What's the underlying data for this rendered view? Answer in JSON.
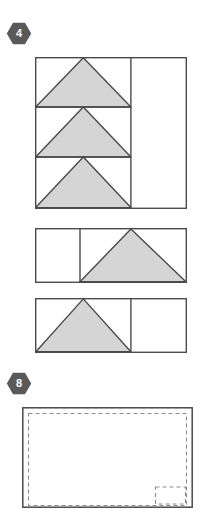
{
  "page": {
    "width": 206,
    "height": 499,
    "background": "#ffffff"
  },
  "style": {
    "stroke_color": "#4a4a4a",
    "fill_shaded": "#d5d5d5",
    "fill_empty": "#ffffff",
    "badge_color": "#595959",
    "badge_text_color": "#ffffff",
    "dashed_color": "#8c8c8c",
    "stroke_width": 1.4
  },
  "badges": [
    {
      "id": "badge-4",
      "label": "4",
      "x": 6,
      "y": 22,
      "shape": "hexagon"
    },
    {
      "id": "badge-8",
      "label": "8",
      "x": 6,
      "y": 372,
      "shape": "hexagon"
    }
  ],
  "figures": [
    {
      "id": "figure-1",
      "name": "square-three-stacked-triangles",
      "x": 35,
      "y": 57,
      "width": 151,
      "height": 151,
      "vertical_divider_x": 96,
      "row_divider_ys": [
        50,
        100
      ],
      "cells": [
        {
          "name": "top-left-cell",
          "shaded": true,
          "shape": "triangle-up"
        },
        {
          "name": "middle-left-cell",
          "shaded": true,
          "shape": "triangle-up"
        },
        {
          "name": "bottom-left-cell",
          "shaded": true,
          "shape": "triangle-up"
        },
        {
          "name": "right-column-cell",
          "shaded": false,
          "shape": "rectangle"
        }
      ]
    },
    {
      "id": "figure-2",
      "name": "rectangle-empty-left-triangle-right",
      "x": 35,
      "y": 228,
      "width": 151,
      "height": 54,
      "vertical_divider_x": 45,
      "cells": [
        {
          "name": "left-cell",
          "shaded": false,
          "shape": "rectangle"
        },
        {
          "name": "right-cell",
          "shaded": true,
          "shape": "triangle-up"
        }
      ]
    },
    {
      "id": "figure-3",
      "name": "rectangle-triangle-left-empty-right",
      "x": 35,
      "y": 298,
      "width": 151,
      "height": 54,
      "vertical_divider_x": 96,
      "cells": [
        {
          "name": "left-cell",
          "shaded": true,
          "shape": "triangle-up"
        },
        {
          "name": "right-cell",
          "shaded": false,
          "shape": "rectangle"
        }
      ]
    },
    {
      "id": "figure-4",
      "name": "rectangle-with-dashed-inset-and-corner-box",
      "x": 22,
      "y": 407,
      "width": 170,
      "height": 100,
      "inset": 6,
      "corner_box": {
        "name": "corner-dashed-box",
        "width": 30,
        "height": 16,
        "right_offset": 6,
        "bottom_offset": 6
      }
    }
  ]
}
